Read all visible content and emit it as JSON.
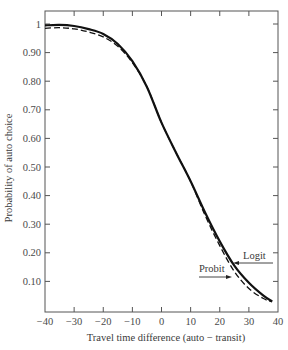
{
  "chart_data": {
    "type": "line",
    "title": "",
    "xlabel": "Travel time difference (auto − transit)",
    "ylabel": "Probability of auto choice",
    "xlim": [
      -40,
      40
    ],
    "ylim": [
      0,
      1.05
    ],
    "x_ticks": [
      -40,
      -30,
      -20,
      -10,
      0,
      10,
      20,
      30,
      40
    ],
    "x_tick_labels": [
      "−40",
      "−30",
      "−20",
      "−10",
      "0",
      "10",
      "20",
      "30",
      "40"
    ],
    "y_ticks": [
      0.1,
      0.2,
      0.3,
      0.4,
      0.5,
      0.6,
      0.7,
      0.8,
      0.9,
      1.0
    ],
    "y_tick_labels": [
      "0.10",
      "0.20",
      "0.30",
      "0.40",
      "0.50",
      "0.60",
      "0.70",
      "0.80",
      "0.90",
      "1"
    ],
    "grid": false,
    "frame": "box with ticks on all sides",
    "series": [
      {
        "name": "Logit",
        "style": "solid",
        "color": "#111111",
        "x": [
          -40,
          -35,
          -30,
          -25,
          -20,
          -15,
          -10,
          -5,
          0,
          5,
          10,
          15,
          20,
          25,
          30,
          35,
          38
        ],
        "y": [
          0.995,
          0.997,
          0.993,
          0.982,
          0.965,
          0.93,
          0.87,
          0.78,
          0.655,
          0.55,
          0.45,
          0.34,
          0.24,
          0.155,
          0.095,
          0.05,
          0.03
        ]
      },
      {
        "name": "Probit",
        "style": "dashed",
        "color": "#111111",
        "x": [
          -40,
          -35,
          -30,
          -25,
          -20,
          -15,
          -10,
          -5,
          0,
          5,
          10,
          15,
          20,
          25,
          30,
          35,
          38
        ],
        "y": [
          0.985,
          0.987,
          0.983,
          0.972,
          0.955,
          0.922,
          0.865,
          0.78,
          0.655,
          0.55,
          0.45,
          0.33,
          0.225,
          0.135,
          0.075,
          0.04,
          0.028
        ]
      }
    ],
    "annotations": [
      {
        "text": "Logit",
        "arrow_to_series": "Logit",
        "at_x": 25,
        "at_y": 0.16
      },
      {
        "text": "Probit",
        "arrow_to_series": "Probit",
        "at_x": 24,
        "at_y": 0.12
      }
    ]
  }
}
